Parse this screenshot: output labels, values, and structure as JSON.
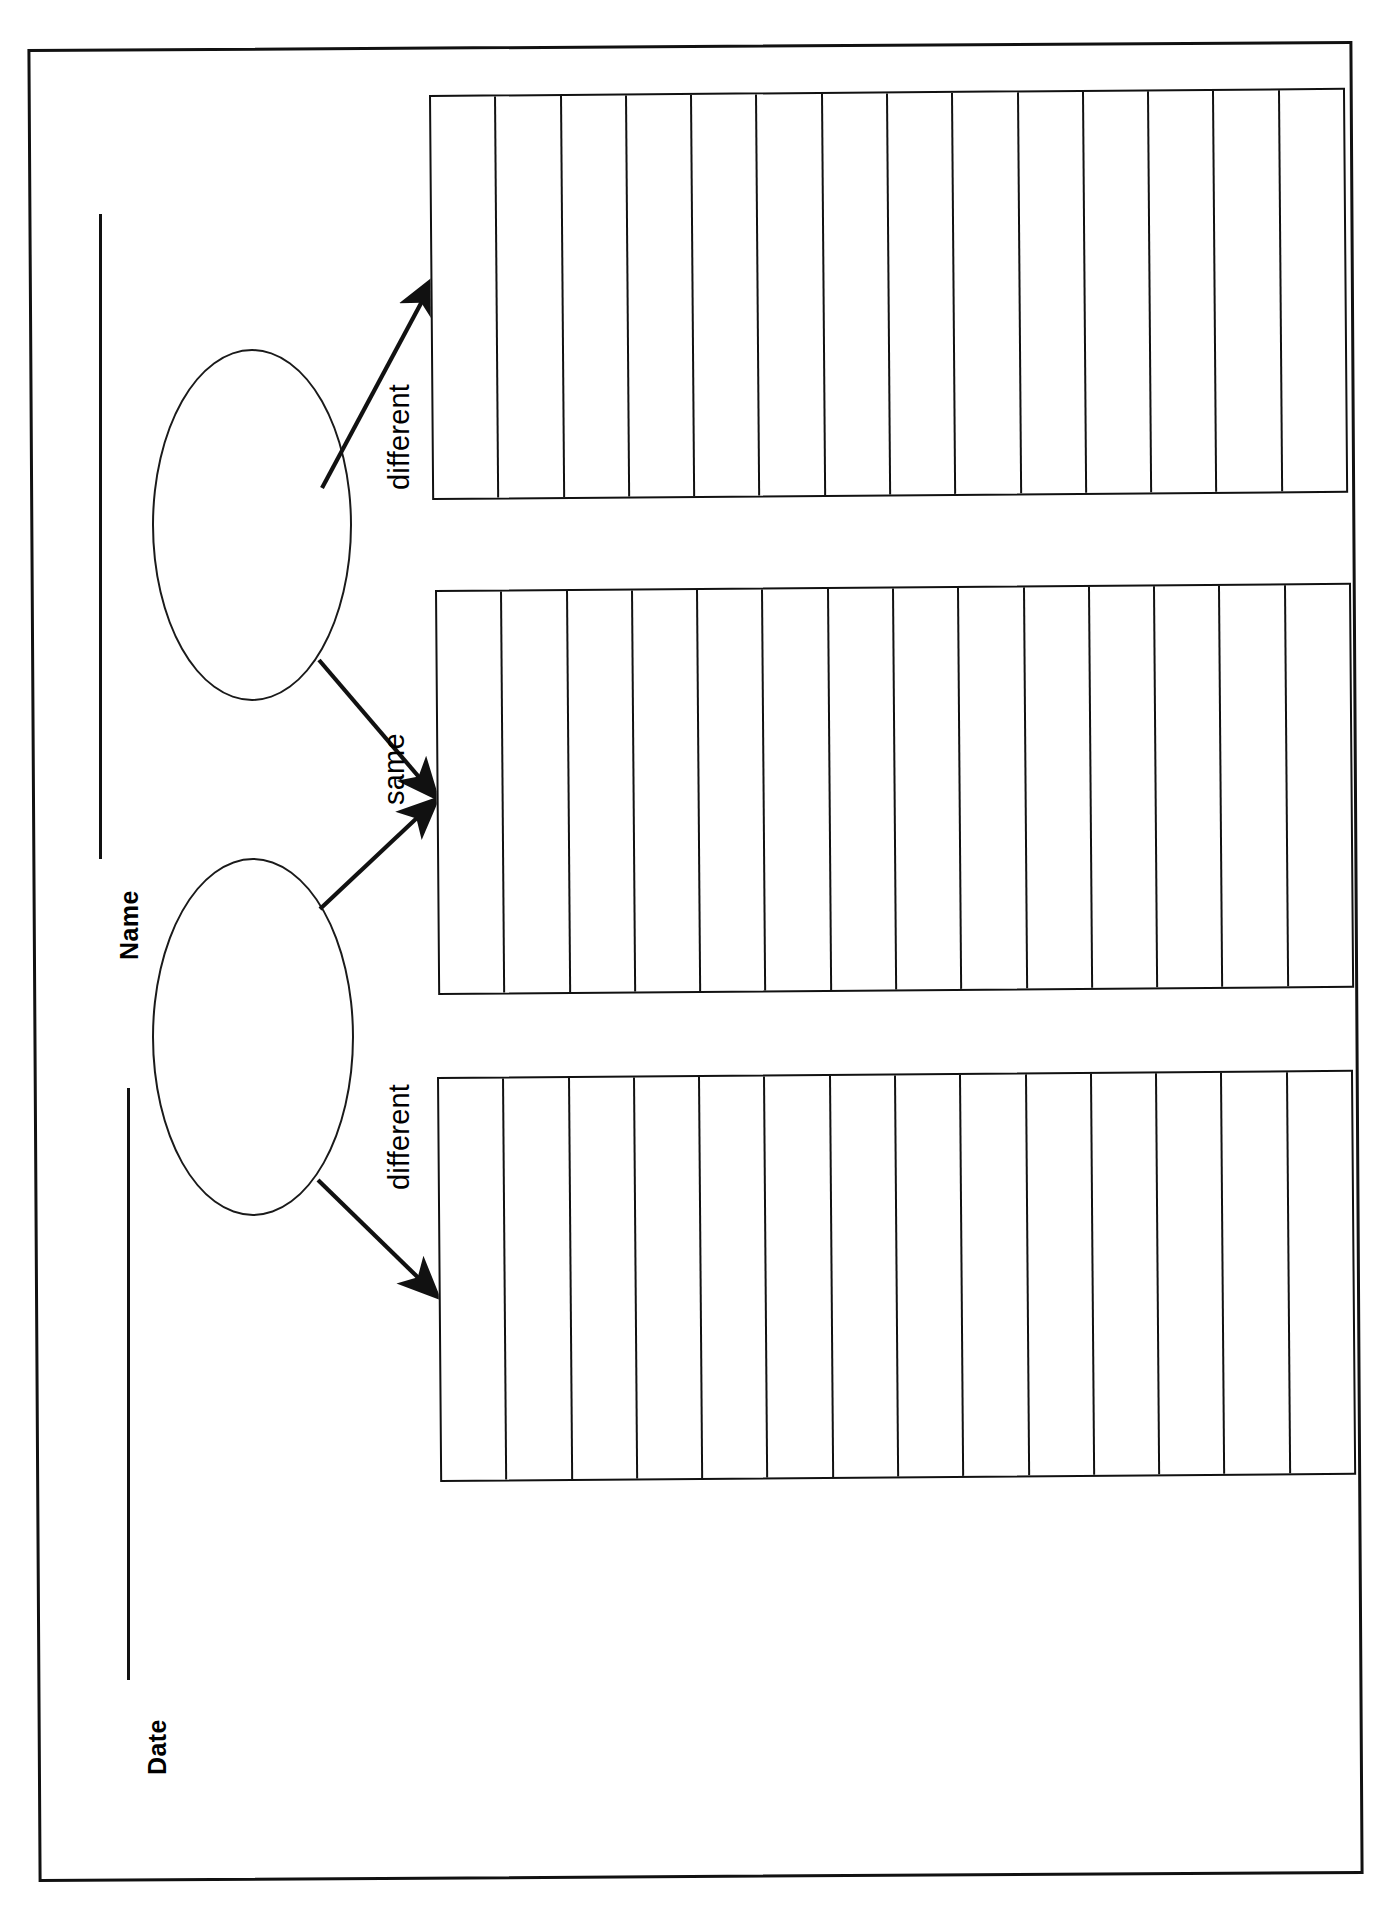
{
  "page": {
    "document_type": "compare-and-contrast graphic organizer worksheet",
    "orientation": "content rotated 90 degrees counter-clockwise on portrait sheet",
    "background_color": "#ffffff",
    "line_color": "#111111"
  },
  "header": {
    "fields": [
      {
        "label": "Name",
        "has_write_in_rule": true
      },
      {
        "label": "Date",
        "has_write_in_rule": true
      }
    ],
    "name_label": "Name",
    "date_label": "Date"
  },
  "bubbles": [
    {
      "id": "topic-bubble-1",
      "label": ""
    },
    {
      "id": "topic-bubble-2",
      "label": ""
    }
  ],
  "connectors": [
    {
      "id": "connector-different-top",
      "label": "different",
      "from": "topic-bubble-1",
      "to": "lined-box-1",
      "arrow": "single"
    },
    {
      "id": "connector-same",
      "label": "same",
      "from": "both-bubbles",
      "to": "lined-box-2",
      "arrow": "double-converging"
    },
    {
      "id": "connector-different-bottom",
      "label": "different",
      "from": "topic-bubble-2",
      "to": "lined-box-3",
      "arrow": "single"
    }
  ],
  "labels": {
    "different_top": "different",
    "same": "same",
    "different_bottom": "different"
  },
  "boxes": [
    {
      "id": "lined-box-1",
      "purpose": "differences for first topic",
      "column_count": 14,
      "content": ""
    },
    {
      "id": "lined-box-2",
      "purpose": "similarities shared by both topics",
      "column_count": 14,
      "content": ""
    },
    {
      "id": "lined-box-3",
      "purpose": "differences for second topic",
      "column_count": 14,
      "content": ""
    }
  ]
}
